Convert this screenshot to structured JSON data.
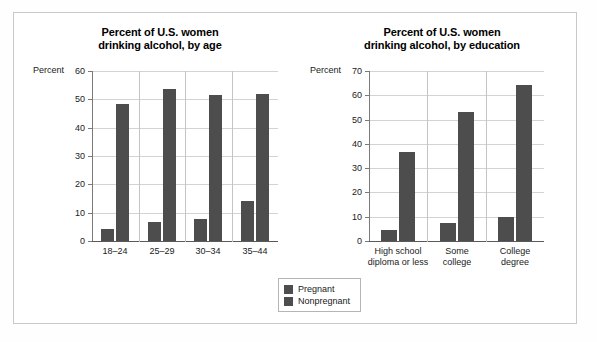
{
  "figure": {
    "background_color": "#ffffff",
    "frame_color": "#c9c9c9",
    "bar_color": "#4d4d4d",
    "gridline_color": "#d3d3d3"
  },
  "legend": {
    "name": "series-legend",
    "entries": [
      {
        "label": "Pregnant",
        "color": "#4d4d4d"
      },
      {
        "label": "Nonpregnant",
        "color": "#4d4d4d"
      }
    ]
  },
  "chart_data": [
    {
      "type": "bar",
      "id": "age",
      "title": "Percent of U.S. women drinking alcohol, by age",
      "title_lines": [
        "Percent of U.S. women",
        "drinking alcohol, by age"
      ],
      "xlabel": "",
      "ylabel": "Percent",
      "ylim": [
        0,
        60
      ],
      "yticks": [
        0,
        10,
        20,
        30,
        40,
        50,
        60
      ],
      "ytick_labels": [
        "0",
        "10",
        "20",
        "30",
        "40",
        "50",
        "60"
      ],
      "grid": true,
      "legend_position": "below-center",
      "categories": [
        "18–24",
        "25–29",
        "30–34",
        "35–44"
      ],
      "category_lines": [
        [
          "18–24"
        ],
        [
          "25–29"
        ],
        [
          "30–34"
        ],
        [
          "35–44"
        ]
      ],
      "series": [
        {
          "name": "Pregnant",
          "values": [
            4.2,
            6.6,
            7.6,
            14.0
          ]
        },
        {
          "name": "Nonpregnant",
          "values": [
            48.3,
            53.6,
            51.4,
            51.9
          ]
        }
      ]
    },
    {
      "type": "bar",
      "id": "education",
      "title": "Percent of U.S. women drinking alcohol, by education",
      "title_lines": [
        "Percent of U.S. women",
        "drinking alcohol, by education"
      ],
      "xlabel": "",
      "ylabel": "Percent",
      "ylim": [
        0,
        70
      ],
      "yticks": [
        0,
        10,
        20,
        30,
        40,
        50,
        60,
        70
      ],
      "ytick_labels": [
        "0",
        "10",
        "20",
        "30",
        "40",
        "50",
        "60",
        "70"
      ],
      "grid": true,
      "legend_position": "below-center",
      "categories": [
        "High school diploma or less",
        "Some college",
        "College degree"
      ],
      "category_lines": [
        [
          "High school",
          "diploma or less"
        ],
        [
          "Some",
          "college"
        ],
        [
          "College",
          "degree"
        ]
      ],
      "series": [
        {
          "name": "Pregnant",
          "values": [
            4.7,
            7.5,
            9.7
          ]
        },
        {
          "name": "Nonpregnant",
          "values": [
            36.7,
            53.2,
            64.2
          ]
        }
      ]
    }
  ]
}
